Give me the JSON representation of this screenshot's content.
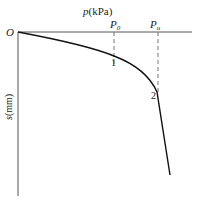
{
  "diagram": {
    "type": "load-settlement curve (p-s curve)",
    "origin_label": "O",
    "x_axis": {
      "label_var": "p",
      "label_unit": "(kPa)"
    },
    "y_axis": {
      "label_var": "s",
      "label_unit": "(mm)"
    },
    "markers": [
      {
        "label_main": "P",
        "label_sub": "0",
        "point_label": "1"
      },
      {
        "label_main": "P",
        "label_sub": "u",
        "point_label": "2"
      }
    ],
    "colors": {
      "axis": "#555555",
      "curve": "#111111",
      "dashed": "#777777",
      "text": "#222222"
    }
  }
}
